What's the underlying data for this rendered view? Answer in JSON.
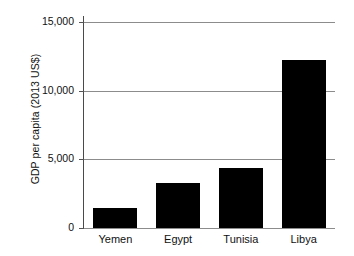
{
  "chart_data": {
    "type": "bar",
    "title": "",
    "subtitle": "",
    "xlabel": "",
    "ylabel": "GDP per capita (2013 US$)",
    "categories": [
      "Yemen",
      "Egypt",
      "Tunisia",
      "Libya"
    ],
    "values": [
      1450,
      3300,
      4400,
      12200
    ],
    "series": [
      {
        "name": "GDP per capita",
        "values": [
          1450,
          3300,
          4400,
          12200
        ],
        "color": "#000000"
      }
    ],
    "ylim": [
      0,
      15000
    ],
    "yticks": [
      0,
      5000,
      10000,
      15000
    ],
    "ytick_labels": [
      "0",
      "5,000",
      "10,000",
      "15,000"
    ],
    "grid": true,
    "grid_axis": "y",
    "legend": false,
    "legend_position": "none",
    "bar_color": "#000000",
    "gridline_color": "#8c8c8c",
    "axis_color": "#4a4a4a",
    "background": "#ffffff"
  }
}
